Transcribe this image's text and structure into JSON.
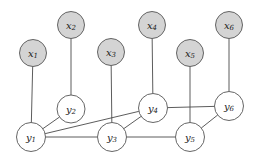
{
  "figure": {
    "title": "",
    "background_color": "#ffffff",
    "width": 255,
    "height": 164
  },
  "style": {
    "observed_fill": "#d4d4d4",
    "latent_fill": "#ffffff",
    "node_stroke": "#555555",
    "edge_stroke": "#4a4a4a",
    "node_radius": 13.5
  },
  "graph_data": {
    "type": "diagram",
    "kind": "undirected-graphical-model",
    "nodes": [
      {
        "id": "x1",
        "base": "x",
        "sub": "1",
        "kind": "observed",
        "cx": 33,
        "cy": 53,
        "r": 13.5
      },
      {
        "id": "x2",
        "base": "x",
        "sub": "2",
        "kind": "observed",
        "cx": 71,
        "cy": 25,
        "r": 13.5
      },
      {
        "id": "x3",
        "base": "x",
        "sub": "3",
        "kind": "observed",
        "cx": 111,
        "cy": 52,
        "r": 13.5
      },
      {
        "id": "x4",
        "base": "x",
        "sub": "4",
        "kind": "observed",
        "cx": 152,
        "cy": 25,
        "r": 13.5
      },
      {
        "id": "x5",
        "base": "x",
        "sub": "5",
        "kind": "observed",
        "cx": 190,
        "cy": 53,
        "r": 13.5
      },
      {
        "id": "x6",
        "base": "x",
        "sub": "6",
        "kind": "observed",
        "cx": 229,
        "cy": 25,
        "r": 13.5
      },
      {
        "id": "y1",
        "base": "y",
        "sub": "1",
        "kind": "latent",
        "cx": 31,
        "cy": 137,
        "r": 14.5
      },
      {
        "id": "y2",
        "base": "y",
        "sub": "2",
        "kind": "latent",
        "cx": 71,
        "cy": 109,
        "r": 14.0
      },
      {
        "id": "y3",
        "base": "y",
        "sub": "3",
        "kind": "latent",
        "cx": 112,
        "cy": 137,
        "r": 14.5
      },
      {
        "id": "y4",
        "base": "y",
        "sub": "4",
        "kind": "latent",
        "cx": 153,
        "cy": 108,
        "r": 14.5
      },
      {
        "id": "y5",
        "base": "y",
        "sub": "5",
        "kind": "latent",
        "cx": 190,
        "cy": 137,
        "r": 14.5
      },
      {
        "id": "y6",
        "base": "y",
        "sub": "6",
        "kind": "latent",
        "cx": 229,
        "cy": 106,
        "r": 14.5
      }
    ],
    "edges": [
      {
        "from": "x1",
        "to": "y1",
        "label": ""
      },
      {
        "from": "x2",
        "to": "y2",
        "label": ""
      },
      {
        "from": "x3",
        "to": "y3",
        "label": ""
      },
      {
        "from": "x4",
        "to": "y4",
        "label": ""
      },
      {
        "from": "x5",
        "to": "y5",
        "label": ""
      },
      {
        "from": "x6",
        "to": "y6",
        "label": ""
      },
      {
        "from": "y1",
        "to": "y2",
        "label": ""
      },
      {
        "from": "y1",
        "to": "y3",
        "label": ""
      },
      {
        "from": "y1",
        "to": "y4",
        "label": ""
      },
      {
        "from": "y3",
        "to": "y4",
        "label": ""
      },
      {
        "from": "y3",
        "to": "y5",
        "label": ""
      },
      {
        "from": "y4",
        "to": "y6",
        "label": ""
      },
      {
        "from": "y5",
        "to": "y6",
        "label": ""
      }
    ],
    "legend": []
  }
}
